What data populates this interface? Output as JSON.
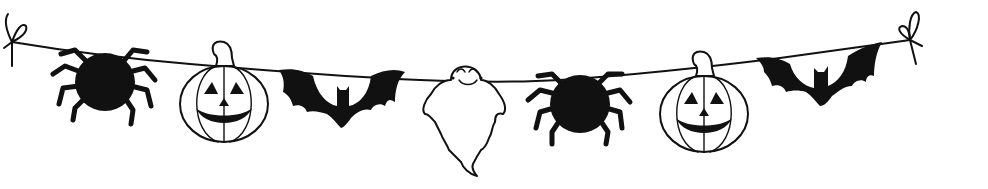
{
  "illustration": {
    "title": "Halloween garland",
    "background_color": "#ffffff",
    "ink_color": "#111111",
    "string": {
      "ends": [
        "bow-knot",
        "bow-knot"
      ]
    },
    "ornaments": [
      {
        "kind": "spider",
        "fill": "black"
      },
      {
        "kind": "jack-o-lantern",
        "fill": "outline",
        "expression": "smiling"
      },
      {
        "kind": "bat",
        "fill": "black"
      },
      {
        "kind": "ghost",
        "fill": "outline",
        "expression": "smiling, closed eyes"
      },
      {
        "kind": "spider",
        "fill": "black"
      },
      {
        "kind": "jack-o-lantern",
        "fill": "outline",
        "expression": "smiling"
      },
      {
        "kind": "bat",
        "fill": "black"
      }
    ]
  }
}
